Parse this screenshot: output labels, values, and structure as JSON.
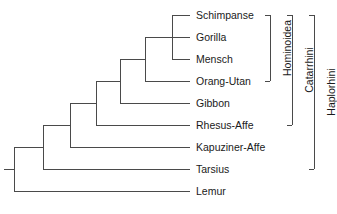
{
  "figure": {
    "type": "cladogram",
    "title": "",
    "orientation": "left-to-right",
    "line_color": "#4a4a4a",
    "text_color": "#1a1a1a",
    "background": "#ffffff"
  },
  "taxa": [
    {
      "name": "Schimpanse",
      "row": 1,
      "y": 15,
      "tip_x": 190
    },
    {
      "name": "Gorilla",
      "row": 2,
      "y": 37,
      "tip_x": 190
    },
    {
      "name": "Mensch",
      "row": 3,
      "y": 59,
      "tip_x": 190
    },
    {
      "name": "Orang-Utan",
      "row": 4,
      "y": 81,
      "tip_x": 190
    },
    {
      "name": "Gibbon",
      "row": 5,
      "y": 103,
      "tip_x": 190
    },
    {
      "name": "Rhesus-Affe",
      "row": 6,
      "y": 125,
      "tip_x": 190
    },
    {
      "name": "Kapuziner-Affe",
      "row": 7,
      "y": 147,
      "tip_x": 190
    },
    {
      "name": "Tarsius",
      "row": 8,
      "y": 169,
      "tip_x": 190
    },
    {
      "name": "Lemur",
      "row": 9,
      "y": 191,
      "tip_x": 190
    }
  ],
  "nodes": [
    {
      "id": "n1",
      "x": 172,
      "joins": [
        "Schimpanse",
        "Mensch"
      ],
      "y_top": 15,
      "y_bottom": 59,
      "y_center": 37
    },
    {
      "id": "n2",
      "x": 158,
      "joins": [
        "n1",
        "Gorilla"
      ],
      "y_top": 37,
      "y_bottom": 37,
      "y_center": 37
    },
    {
      "id": "n3",
      "x": 145,
      "joins": [
        "n2",
        "Orang-Utan"
      ],
      "y_top": 37,
      "y_bottom": 81,
      "y_center": 59
    },
    {
      "id": "n4",
      "x": 120,
      "joins": [
        "n3",
        "Gibbon"
      ],
      "y_top": 59,
      "y_bottom": 103,
      "y_center": 81
    },
    {
      "id": "n5",
      "x": 96,
      "joins": [
        "n4",
        "Rhesus-Affe"
      ],
      "y_top": 81,
      "y_bottom": 125,
      "y_center": 103
    },
    {
      "id": "n6",
      "x": 70,
      "joins": [
        "n5",
        "Kapuziner-Affe"
      ],
      "y_top": 103,
      "y_bottom": 147,
      "y_center": 125
    },
    {
      "id": "n7",
      "x": 43,
      "joins": [
        "n6",
        "Tarsius"
      ],
      "y_top": 125,
      "y_bottom": 169,
      "y_center": 147
    },
    {
      "id": "n8",
      "x": 14,
      "joins": [
        "n7",
        "Lemur"
      ],
      "y_top": 147,
      "y_bottom": 191,
      "y_center": 169
    }
  ],
  "root": {
    "x_start": 4,
    "x_end": 14,
    "y": 169
  },
  "clades": [
    {
      "name": "Hominoidea",
      "bracket_x": 270,
      "y_top": 15,
      "y_bottom": 81,
      "label_x": 282,
      "tick_width": 5,
      "members": [
        "Schimpanse",
        "Gorilla",
        "Mensch",
        "Orang-Utan"
      ]
    },
    {
      "name": "Catarrhini",
      "bracket_x": 292,
      "y_top": 15,
      "y_bottom": 125,
      "label_x": 304,
      "tick_width": 5,
      "members": [
        "Schimpanse",
        "Gorilla",
        "Mensch",
        "Orang-Utan",
        "Gibbon",
        "Rhesus-Affe"
      ]
    },
    {
      "name": "Haplorhini",
      "bracket_x": 314,
      "y_top": 15,
      "y_bottom": 169,
      "label_x": 326,
      "tick_width": 5,
      "members": [
        "Schimpanse",
        "Gorilla",
        "Mensch",
        "Orang-Utan",
        "Gibbon",
        "Rhesus-Affe",
        "Kapuziner-Affe",
        "Tarsius"
      ]
    }
  ]
}
